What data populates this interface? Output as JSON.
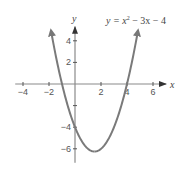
{
  "chart_data": {
    "type": "line",
    "title": "",
    "equation": "y = x² − 3x − 4",
    "equation_parts": {
      "lhs": "y = x",
      "exp": "2",
      "rhs": " − 3x − 4"
    },
    "xlabel": "x",
    "ylabel": "y",
    "xlim": [
      -4.5,
      6.8
    ],
    "ylim": [
      -7,
      5.5
    ],
    "x_ticks": [
      -4,
      -2,
      2,
      4,
      6
    ],
    "x_tick_labels": [
      "−4",
      "−2",
      "2",
      "4",
      "6"
    ],
    "y_ticks": [
      4,
      2,
      -2,
      -4,
      -6
    ],
    "y_tick_labels": [
      "4",
      "2",
      "",
      "−4",
      "−6"
    ],
    "grid": false,
    "series": [
      {
        "name": "y = x^2 - 3x - 4",
        "function": "x^2 - 3x - 4",
        "x_range": [
          -1.85,
          4.85
        ],
        "key_points": [
          {
            "x": -1,
            "y": 0,
            "note": "x-intercept"
          },
          {
            "x": 4,
            "y": 0,
            "note": "x-intercept"
          },
          {
            "x": 0,
            "y": -4,
            "note": "y-intercept"
          },
          {
            "x": 1.5,
            "y": -6.25,
            "note": "vertex"
          }
        ],
        "color": "#7a7a7a"
      }
    ],
    "axis_color": "#8a8a8a"
  }
}
